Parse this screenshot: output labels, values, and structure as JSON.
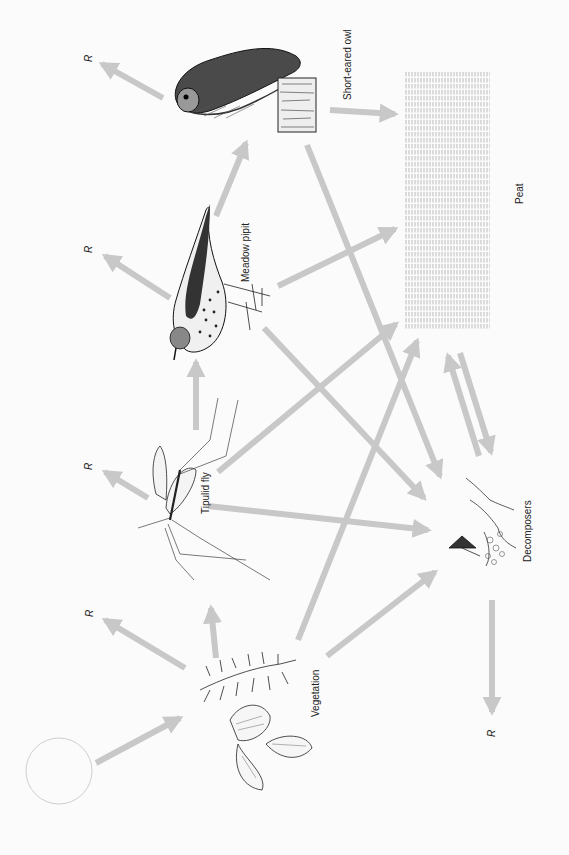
{
  "diagram": {
    "style": {
      "arrow_color": "#c8c8c8",
      "peat_line_color": "#b0b0b0",
      "text_color": "#222222",
      "background": "#fbfbfb"
    },
    "nodes": {
      "sun": {
        "label": ""
      },
      "vegetation": {
        "label": "Vegetation"
      },
      "tipulid": {
        "label": "Tipulid fly"
      },
      "pipit": {
        "label": "Meadow pipit"
      },
      "owl": {
        "label": "Short-eared owl"
      },
      "peat": {
        "label": "Peat"
      },
      "decomposers": {
        "label": "Decomposers"
      }
    },
    "respiration_label": "R",
    "respiration": [
      {
        "from": "vegetation",
        "label": "R"
      },
      {
        "from": "tipulid",
        "label": "R"
      },
      {
        "from": "pipit",
        "label": "R"
      },
      {
        "from": "owl",
        "label": "R"
      },
      {
        "from": "decomposers",
        "label": "R"
      }
    ],
    "edges": [
      {
        "from": "sun",
        "to": "vegetation"
      },
      {
        "from": "vegetation",
        "to": "tipulid"
      },
      {
        "from": "tipulid",
        "to": "pipit"
      },
      {
        "from": "pipit",
        "to": "owl"
      },
      {
        "from": "owl",
        "to": "peat"
      },
      {
        "from": "pipit",
        "to": "peat"
      },
      {
        "from": "tipulid",
        "to": "peat"
      },
      {
        "from": "vegetation",
        "to": "peat"
      },
      {
        "from": "owl",
        "to": "decomposers"
      },
      {
        "from": "pipit",
        "to": "decomposers"
      },
      {
        "from": "tipulid",
        "to": "decomposers"
      },
      {
        "from": "vegetation",
        "to": "decomposers"
      },
      {
        "from": "peat",
        "to": "decomposers"
      },
      {
        "from": "decomposers",
        "to": "peat"
      }
    ]
  }
}
